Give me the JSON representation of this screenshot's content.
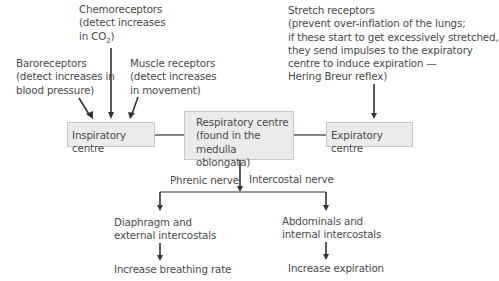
{
  "diagram": {
    "inputs": {
      "chemoreceptors": {
        "line1": "Chemoreceptors",
        "line2": "(detect increases",
        "line3_pre": "in CO",
        "line3_sub": "2",
        "line3_post": ")"
      },
      "baroreceptors": {
        "line1": "Baroreceptors",
        "line2": "(detect increases in",
        "line3": "blood pressure)"
      },
      "muscle_receptors": {
        "line1": "Muscle receptors",
        "line2": "(detect increases",
        "line3": "in movement)"
      },
      "stretch_receptors": {
        "line1": "Stretch receptors",
        "line2": "(prevent over-inflation of the lungs;",
        "line3": "if these start to get excessively stretched,",
        "line4": "they send impulses to the expiratory",
        "line5": "centre to induce expiration —",
        "line6": "Hering Breur reflex)"
      }
    },
    "centres": {
      "inspiratory": "Inspiratory centre",
      "respiratory": {
        "line1": "Respiratory centre",
        "line2": "(found in the",
        "line3": "medulla oblongata)"
      },
      "expiratory": "Expiratory centre"
    },
    "nerves": {
      "left": "Phrenic nerve",
      "right": "Intercostal nerve"
    },
    "effectors": {
      "left": {
        "line1": "Diaphragm and",
        "line2": "external intercostals"
      },
      "right": {
        "line1": "Abdominals and",
        "line2": "internal intercostals"
      }
    },
    "outcomes": {
      "left": "Increase breathing rate",
      "right": "Increase expiration"
    },
    "colors": {
      "box_fill": "#ebebeb",
      "box_border": "#c9c9c9",
      "text": "#4a4a4a",
      "lines": "#333333"
    }
  }
}
